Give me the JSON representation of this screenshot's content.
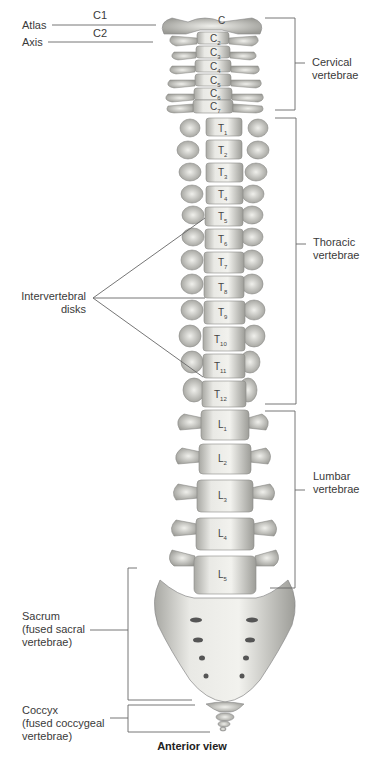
{
  "diagram": {
    "caption": "Anterior view",
    "labels": {
      "atlas": "Atlas",
      "axis": "Axis",
      "c1": "C1",
      "c2": "C2",
      "cervical": [
        "Cervical",
        "vertebrae"
      ],
      "thoracic": [
        "Thoracic",
        "vertebrae"
      ],
      "lumbar": [
        "Lumbar",
        "vertebrae"
      ],
      "intervertebral": [
        "Intervertebral",
        "disks"
      ],
      "sacrum": [
        "Sacrum",
        "(fused sacral",
        "vertebrae)"
      ],
      "coccyx": [
        "Coccyx",
        "(fused coccygeal",
        "vertebrae)"
      ]
    },
    "vertebrae": {
      "cervical": [
        "C1",
        "C2",
        "C3",
        "C4",
        "C5",
        "C6",
        "C7"
      ],
      "thoracic": [
        "T1",
        "T2",
        "T3",
        "T4",
        "T5",
        "T6",
        "T7",
        "T8",
        "T9",
        "T10",
        "T11",
        "T12"
      ],
      "lumbar": [
        "L1",
        "L2",
        "L3",
        "L4",
        "L5"
      ]
    },
    "colors": {
      "bone": "#e4e4e0",
      "bone_shadow": "#a9a9a4",
      "line": "#555555",
      "text": "#3a3a3a"
    }
  }
}
